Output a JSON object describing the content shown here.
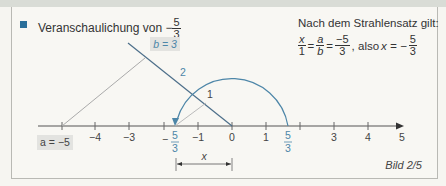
{
  "title": {
    "prefix": "Veranschaulichung von",
    "sign": "−",
    "numerator": "5",
    "denominator": "3"
  },
  "rule": {
    "heading": "Nach dem Strahlensatz gilt:",
    "eq": {
      "f1_num": "x",
      "f1_den": "1",
      "f2_num": "a",
      "f2_den": "b",
      "f3_num": "−5",
      "f3_den": "3",
      "also": ", also",
      "x_lhs": "x = −",
      "f4_num": "5",
      "f4_den": "3"
    }
  },
  "diagram": {
    "b_label": "b = 3",
    "a_label": "a = −5",
    "seg_2": "2",
    "seg_1": "1",
    "x_label": "x",
    "ticks": [
      "−4",
      "−3",
      "−1",
      "0",
      "1",
      "3",
      "4",
      "5"
    ],
    "neg_frac": {
      "sign": "−",
      "num": "5",
      "den": "3"
    },
    "pos_frac": {
      "num": "5",
      "den": "3"
    },
    "colors": {
      "accent": "#4d86a8",
      "line": "#555555",
      "grey": "#999999",
      "label_bg": "#e3e3e0"
    }
  },
  "caption": "Bild 2/5"
}
